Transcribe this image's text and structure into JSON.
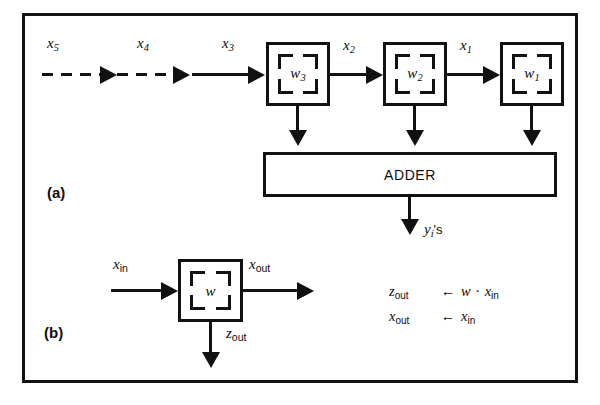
{
  "figure": {
    "background_color": "#ffffff",
    "ink_color": "#111111",
    "panels": [
      {
        "tag": "(a)",
        "name": "systolic-array-panel"
      },
      {
        "tag": "(b)",
        "name": "single-cell-panel"
      }
    ]
  },
  "panel_a": {
    "tag": "(a)",
    "input_labels": [
      "x5",
      "x4",
      "x3"
    ],
    "input_labels_rendered": [
      {
        "base": "x",
        "sub": "5"
      },
      {
        "base": "x",
        "sub": "4"
      },
      {
        "base": "x",
        "sub": "3"
      }
    ],
    "dashed_arrows": 2,
    "solid_input_arrows": 1,
    "cells": [
      {
        "label_base": "w",
        "label_sub": "3",
        "name": "weight-cell-w3"
      },
      {
        "label_base": "w",
        "label_sub": "2",
        "name": "weight-cell-w2"
      },
      {
        "label_base": "w",
        "label_sub": "1",
        "name": "weight-cell-w1"
      }
    ],
    "interconnect_labels": [
      {
        "base": "x",
        "sub": "2"
      },
      {
        "base": "x",
        "sub": "1"
      }
    ],
    "adder": {
      "label": "ADDER"
    },
    "adder_output": {
      "base": "y",
      "sub": "i",
      "suffix": "'s"
    }
  },
  "panel_b": {
    "tag": "(b)",
    "cell": {
      "label_base": "w",
      "label_sub": "",
      "name": "weight-cell-w"
    },
    "input_label": {
      "base": "x",
      "sub": "in"
    },
    "output_label": {
      "base": "x",
      "sub": "out"
    },
    "down_label": {
      "base": "z",
      "sub": "out"
    },
    "equations": [
      {
        "lhs_base": "z",
        "lhs_sub": "out",
        "op": "←",
        "rhs": "w · x",
        "rhs_sub": "in",
        "text": "z_out ← w · x_in"
      },
      {
        "lhs_base": "x",
        "lhs_sub": "out",
        "op": "←",
        "rhs": "x",
        "rhs_sub": "in",
        "text": "x_out ← x_in"
      }
    ]
  }
}
